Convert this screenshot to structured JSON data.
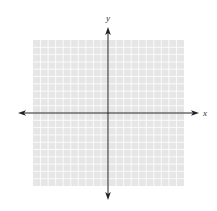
{
  "diagram": {
    "type": "coordinate-plane",
    "grid": {
      "columns": 20,
      "rows": 20,
      "left": 33,
      "top": 40,
      "right": 184,
      "bottom": 186,
      "fill_color": "#e6e6e6",
      "line_color": "#ffffff"
    },
    "axes": {
      "origin_x": 108,
      "origin_y": 113,
      "color": "#222222",
      "x_axis": {
        "label": "x",
        "from": 18,
        "to": 199
      },
      "y_axis": {
        "label": "y",
        "from": 27,
        "to": 200
      }
    }
  }
}
